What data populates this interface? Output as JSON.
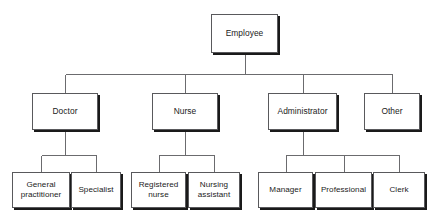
{
  "diagram": {
    "type": "organizational-hierarchy-chart",
    "levels": 3,
    "colors": {
      "background": "#ffffff",
      "box_fill": "#ffffff",
      "box_border": "#59595c",
      "box_shadow": "#1a1a1a",
      "connector": "#6b6b6e",
      "text": "#1b1b1b"
    },
    "root": {
      "id": "employee",
      "label": "Employee",
      "box": {
        "x": 211,
        "y": 14,
        "w": 67,
        "h": 39
      }
    },
    "level2": [
      {
        "id": "doctor",
        "label": "Doctor",
        "box": {
          "x": 32,
          "y": 93,
          "w": 66,
          "h": 37
        },
        "children": [
          {
            "id": "general-practitioner",
            "label": "General\npractitioner",
            "box": {
              "x": 12,
              "y": 172,
              "w": 58,
              "h": 36
            }
          },
          {
            "id": "specialist",
            "label": "Specialist",
            "box": {
              "x": 71,
              "y": 172,
              "w": 50,
              "h": 36
            }
          }
        ]
      },
      {
        "id": "nurse",
        "label": "Nurse",
        "box": {
          "x": 152,
          "y": 93,
          "w": 66,
          "h": 37
        },
        "children": [
          {
            "id": "registered-nurse",
            "label": "Registered\nnurse",
            "box": {
              "x": 131,
              "y": 172,
              "w": 55,
              "h": 36
            }
          },
          {
            "id": "nursing-assistant",
            "label": "Nursing\nassistant",
            "box": {
              "x": 188,
              "y": 172,
              "w": 52,
              "h": 36
            }
          }
        ]
      },
      {
        "id": "administrator",
        "label": "Administrator",
        "box": {
          "x": 268,
          "y": 93,
          "w": 69,
          "h": 37
        },
        "children": [
          {
            "id": "manager",
            "label": "Manager",
            "box": {
              "x": 258,
              "y": 172,
              "w": 55,
              "h": 36
            }
          },
          {
            "id": "professional",
            "label": "Professional",
            "box": {
              "x": 315,
              "y": 172,
              "w": 57,
              "h": 36
            }
          },
          {
            "id": "clerk",
            "label": "Clerk",
            "box": {
              "x": 373,
              "y": 172,
              "w": 52,
              "h": 36
            }
          }
        ]
      },
      {
        "id": "other",
        "label": "Other",
        "box": {
          "x": 364,
          "y": 93,
          "w": 56,
          "h": 37
        },
        "children": []
      }
    ],
    "connector_geometry": {
      "root_stem_y": 74,
      "level2_bus_y": 74,
      "level3_bus_offsets": [
        155,
        155,
        155
      ]
    }
  }
}
